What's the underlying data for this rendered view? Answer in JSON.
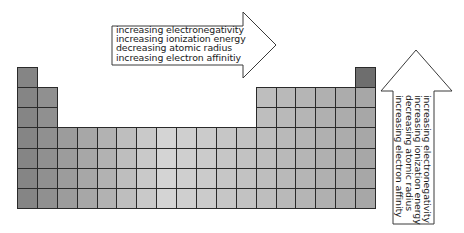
{
  "diagram": {
    "type": "periodic-table-trends",
    "grid": {
      "columns": 18,
      "rows": 7,
      "cell_layout": [
        [
          1,
          0,
          0,
          0,
          0,
          0,
          0,
          0,
          0,
          0,
          0,
          0,
          0,
          0,
          0,
          0,
          0,
          1
        ],
        [
          1,
          1,
          0,
          0,
          0,
          0,
          0,
          0,
          0,
          0,
          0,
          0,
          1,
          1,
          1,
          1,
          1,
          1
        ],
        [
          1,
          1,
          0,
          0,
          0,
          0,
          0,
          0,
          0,
          0,
          0,
          0,
          1,
          1,
          1,
          1,
          1,
          1
        ],
        [
          1,
          1,
          1,
          1,
          1,
          1,
          1,
          1,
          1,
          1,
          1,
          1,
          1,
          1,
          1,
          1,
          1,
          1
        ],
        [
          1,
          1,
          1,
          1,
          1,
          1,
          1,
          1,
          1,
          1,
          1,
          1,
          1,
          1,
          1,
          1,
          1,
          1
        ],
        [
          1,
          1,
          1,
          1,
          1,
          1,
          1,
          1,
          1,
          1,
          1,
          1,
          1,
          1,
          1,
          1,
          1,
          1
        ],
        [
          1,
          1,
          1,
          1,
          1,
          1,
          1,
          1,
          1,
          1,
          1,
          1,
          1,
          1,
          1,
          1,
          1,
          1
        ]
      ],
      "colors": {
        "edge": "#7f7f7f",
        "center": "#d4d4d4",
        "noble_gas_top": "#6e6e6e",
        "border": "#2a2a2a"
      }
    },
    "horizontal_arrow": {
      "direction": "right",
      "lines": [
        "increasing electronegativity",
        "increasing ionization energy",
        "decreasing atomic radius",
        "increasing electron affinitiy"
      ]
    },
    "vertical_arrow": {
      "direction": "up",
      "lines": [
        "increasing electronegativity",
        "increasing ionization energy",
        "decreasing atomic radius",
        "increasing electron affinity"
      ]
    }
  }
}
